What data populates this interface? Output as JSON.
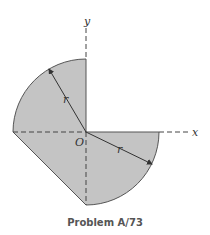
{
  "figure": {
    "caption": "Problem A/73",
    "axes": {
      "x_label": "x",
      "y_label": "y",
      "origin_label": "O"
    },
    "dimensions": {
      "radius_label_upper": "r",
      "radius_label_lower": "r"
    },
    "colors": {
      "fill": "#c4c4c4",
      "stroke": "#555555",
      "axis": "#444444"
    }
  }
}
